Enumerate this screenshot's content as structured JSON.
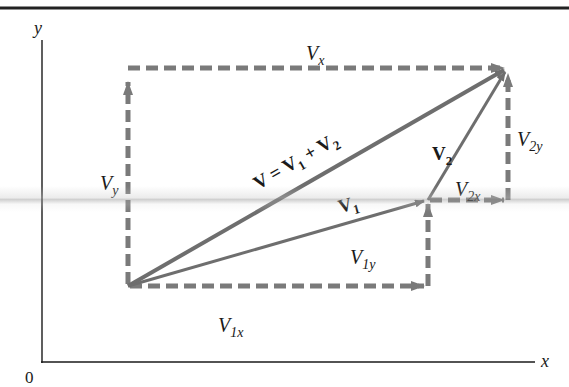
{
  "diagram": {
    "colors": {
      "axis": "#1a1a1a",
      "vector": "#6e6e6e",
      "component": "#7a7a7a",
      "top_rule": "#222222",
      "text": "#1a1a1a"
    },
    "axes": {
      "x_label": "x",
      "y_label": "y",
      "origin_label": "0"
    },
    "vectors": [
      {
        "id": "V",
        "label_bold": "V",
        "label_rest": " = V",
        "sub1": "1",
        "plus": " + V",
        "sub2": "2"
      },
      {
        "id": "V1",
        "label_bold": "V",
        "sub": "1"
      },
      {
        "id": "V2",
        "label_bold": "V",
        "sub": "2"
      }
    ],
    "components": {
      "Vx": {
        "main": "V",
        "sub": "x"
      },
      "Vy": {
        "main": "V",
        "sub": "y"
      },
      "V1x": {
        "main": "V",
        "sub": "1x"
      },
      "V1y": {
        "main": "V",
        "sub": "1y"
      },
      "V2x": {
        "main": "V",
        "sub": "2x"
      },
      "V2y": {
        "main": "V",
        "sub": "2y"
      }
    }
  }
}
